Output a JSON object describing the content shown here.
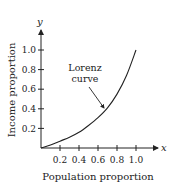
{
  "chart_data": {
    "type": "line",
    "title": "",
    "xlabel": "Population proportion",
    "ylabel": "Income proportion",
    "x_axis_variable": "x",
    "y_axis_variable": "y",
    "xlim": [
      0,
      1.0
    ],
    "ylim": [
      0,
      1.0
    ],
    "x_ticks": [
      "0.2",
      "0.4",
      "0.6",
      "0.8",
      "1.0"
    ],
    "y_ticks": [
      "0.2",
      "0.4",
      "0.6",
      "0.8",
      "1.0"
    ],
    "grid": false,
    "legend": null,
    "series": [
      {
        "name": "Lorenz curve",
        "x": [
          0,
          0.1,
          0.2,
          0.3,
          0.4,
          0.5,
          0.6,
          0.7,
          0.8,
          0.9,
          1.0
        ],
        "y": [
          0,
          0.03,
          0.07,
          0.11,
          0.16,
          0.23,
          0.31,
          0.41,
          0.55,
          0.74,
          1.0
        ]
      }
    ],
    "annotations": [
      {
        "text_line1": "Lorenz",
        "text_line2": "curve",
        "points_to": [
          0.66,
          0.37
        ]
      }
    ]
  }
}
